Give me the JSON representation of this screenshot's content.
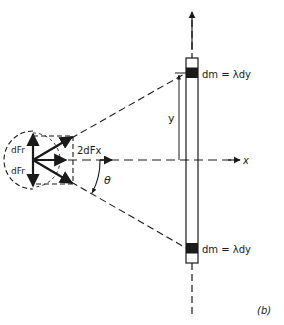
{
  "figure": {
    "panel_label": "(b)",
    "labels": {
      "dm_top": "dm = λdy",
      "dm_bottom": "dm = λdy",
      "y": "y",
      "x": "x",
      "theta": "θ",
      "dFr_top": "dFr",
      "dFr_bottom": "dFr",
      "two_dFx": "2dFx"
    },
    "colors": {
      "ink": "#1a1a1a",
      "background": "#ffffff"
    }
  }
}
